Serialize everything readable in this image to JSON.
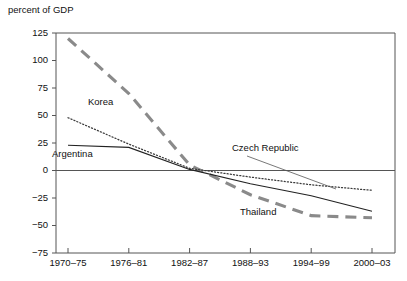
{
  "chart": {
    "title": "percent of GDP"
  },
  "chart_data": {
    "type": "line",
    "title": "percent of GDP",
    "xlabel": "",
    "ylabel": "percent of GDP",
    "categories": [
      "1970–75",
      "1976–81",
      "1982–87",
      "1988–93",
      "1994–99",
      "2000–03"
    ],
    "ylim": [
      -75,
      125
    ],
    "yticks": [
      125,
      100,
      75,
      50,
      25,
      0,
      -25,
      -50,
      -75
    ],
    "ytick_labels": [
      "125",
      "100",
      "75",
      "50",
      "25",
      "0",
      "−25",
      "−50",
      "−75"
    ],
    "grid": false,
    "legend": "inline-annotations",
    "series": [
      {
        "name": "Thailand",
        "style": "thick-dashed-gray",
        "color": "#8a8a8a",
        "values": [
          120,
          70,
          5,
          -22,
          -41,
          -43
        ]
      },
      {
        "name": "Korea",
        "style": "dotted",
        "color": "#3a3a3a",
        "values": [
          48,
          24,
          2,
          -6,
          -13,
          -18
        ]
      },
      {
        "name": "Argentina",
        "style": "solid",
        "color": "#222222",
        "values": [
          23,
          21,
          1,
          -12,
          -23,
          -37
        ]
      }
    ],
    "annotations": [
      {
        "label": "Korea",
        "x": 88,
        "y": 105
      },
      {
        "label": "Argentina",
        "x": 52,
        "y": 157
      },
      {
        "label": "Czech Republic",
        "x": 232,
        "y": 151
      },
      {
        "label": "Thailand",
        "x": 240,
        "y": 215
      }
    ]
  },
  "axis": {
    "y_labels": [
      "125",
      "100",
      "75",
      "50",
      "25",
      "0",
      "−25",
      "−50",
      "−75"
    ],
    "x_labels": [
      "1970–75",
      "1976–81",
      "1982–87",
      "1988–93",
      "1994–99",
      "2000–03"
    ]
  }
}
